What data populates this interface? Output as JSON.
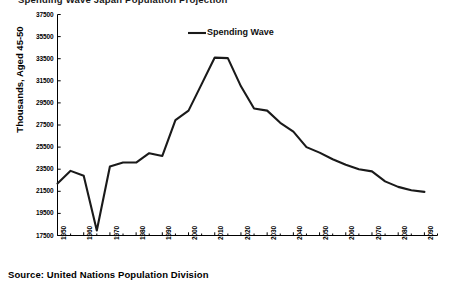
{
  "figure": {
    "cut_off_title": "Spending Wave Japan Population Projection",
    "source_note": "Source: United Nations Population Division"
  },
  "chart_data": {
    "type": "line",
    "title": "",
    "xlabel": "",
    "ylabel": "Thousands, Aged 45-50",
    "xlim": [
      1950,
      2095
    ],
    "ylim": [
      17500,
      37500
    ],
    "ytick_step": 2000,
    "xtick_step": 10,
    "minor_xtick_step": 5,
    "grid": false,
    "legend_position": "top-center",
    "ytick_labels": [
      "17500",
      "19500",
      "21500",
      "23500",
      "25500",
      "27500",
      "29500",
      "31500",
      "33500",
      "35500",
      "37500"
    ],
    "ytick_values": [
      17500,
      19500,
      21500,
      23500,
      25500,
      27500,
      29500,
      31500,
      33500,
      35500,
      37500
    ],
    "xtick_labels": [
      "1950",
      "1960",
      "1970",
      "1980",
      "1990",
      "2000",
      "2010",
      "2020",
      "2030",
      "2040",
      "2050",
      "2060",
      "2070",
      "2080",
      "2090"
    ],
    "xtick_values": [
      1950,
      1960,
      1970,
      1980,
      1990,
      2000,
      2010,
      2020,
      2030,
      2040,
      2050,
      2060,
      2070,
      2080,
      2090
    ],
    "series": [
      {
        "name": "Spending Wave",
        "color": "#1a1a1a",
        "x": [
          1950,
          1955,
          1960,
          1965,
          1970,
          1975,
          1980,
          1985,
          1990,
          1995,
          2000,
          2005,
          2010,
          2015,
          2020,
          2025,
          2030,
          2035,
          2040,
          2045,
          2050,
          2055,
          2060,
          2065,
          2070,
          2075,
          2080,
          2085,
          2090
        ],
        "values": [
          22200,
          23350,
          22900,
          17950,
          23750,
          24100,
          24100,
          24950,
          24700,
          27950,
          28800,
          31200,
          33600,
          33550,
          31000,
          29000,
          28800,
          27700,
          26900,
          25500,
          25000,
          24400,
          23900,
          23500,
          23300,
          22400,
          21900,
          21600,
          21450
        ]
      }
    ]
  },
  "legend": {
    "entries": [
      {
        "label": "Spending Wave",
        "color": "#1a1a1a"
      }
    ]
  }
}
